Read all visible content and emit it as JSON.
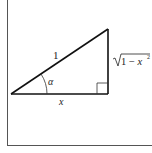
{
  "diagram": {
    "type": "right-triangle",
    "labels": {
      "hypotenuse": "1",
      "angle": "α",
      "adjacent": "x",
      "opposite_radicand": "1 − x",
      "opposite_exponent": "2"
    },
    "colors": {
      "stroke": "#111111",
      "border": "#555555",
      "background": "#ffffff"
    }
  }
}
